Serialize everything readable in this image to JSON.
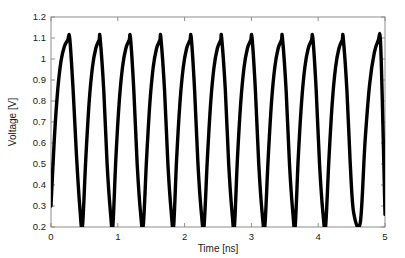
{
  "figure": {
    "background_color": "#ffffff",
    "axis_color": "#8d8d8d",
    "curve_color": "#000000"
  },
  "chart_data": {
    "type": "line",
    "title": "",
    "subtitle": "",
    "xlabel": "Time [ns]",
    "ylabel": "Voltage [V]",
    "xlim": [
      0,
      5
    ],
    "ylim": [
      0.2,
      1.2
    ],
    "xticks": [
      0,
      1,
      2,
      3,
      4,
      5
    ],
    "xticklabels": [
      "0",
      "1",
      "2",
      "3",
      "4",
      "5"
    ],
    "yticks": [
      0.2,
      0.3,
      0.4,
      0.5,
      0.6,
      0.7,
      0.8,
      0.9,
      1.0,
      1.1,
      1.2
    ],
    "yticklabels": [
      "0.2",
      "0.3",
      "0.4",
      "0.5",
      "0.6",
      "0.7",
      "0.8",
      "0.9",
      "1",
      "1.1",
      "1.2"
    ],
    "grid": false,
    "legend": null,
    "annotations": [],
    "series": [
      {
        "name": "ring-oscillator-output",
        "line_color": "#000000",
        "line_width": 3.4,
        "waveform": "relaxation-oscillation",
        "period_ns": 0.4545,
        "cycles": 11,
        "peak_voltage": 1.1,
        "valley_voltage": 0.2,
        "start_voltage": 0.3,
        "rise_fraction": 0.62,
        "fall_fraction": 0.38,
        "peak_times_ns": [
          0.28,
          0.735,
          1.19,
          1.645,
          2.1,
          2.555,
          3.01,
          3.465,
          3.92,
          4.375,
          4.93
        ],
        "valley_times_ns": [
          0.47,
          0.925,
          1.38,
          1.835,
          2.29,
          2.745,
          3.2,
          3.655,
          4.11,
          4.63
        ],
        "x": [
          0.0,
          0.05,
          0.1,
          0.15,
          0.2,
          0.25,
          0.28,
          0.33,
          0.38,
          0.43,
          0.47,
          0.52,
          0.57,
          0.62,
          0.67,
          0.72,
          0.735,
          0.79,
          0.84,
          0.89,
          0.925,
          0.97,
          1.02,
          1.07,
          1.12,
          1.17,
          1.19,
          1.24,
          1.29,
          1.34,
          1.38,
          1.43,
          1.48,
          1.53,
          1.58,
          1.63,
          1.645,
          1.7,
          1.75,
          1.8,
          1.835,
          1.88,
          1.93,
          1.98,
          2.03,
          2.08,
          2.1,
          2.15,
          2.2,
          2.25,
          2.29,
          2.34,
          2.39,
          2.44,
          2.49,
          2.54,
          2.555,
          2.61,
          2.66,
          2.71,
          2.745,
          2.79,
          2.84,
          2.89,
          2.94,
          2.99,
          3.01,
          3.06,
          3.11,
          3.16,
          3.2,
          3.25,
          3.3,
          3.35,
          3.4,
          3.45,
          3.465,
          3.52,
          3.57,
          3.62,
          3.655,
          3.7,
          3.75,
          3.8,
          3.85,
          3.9,
          3.92,
          3.97,
          4.02,
          4.07,
          4.11,
          4.16,
          4.21,
          4.26,
          4.31,
          4.36,
          4.375,
          4.43,
          4.48,
          4.53,
          4.63,
          4.7,
          4.77,
          4.84,
          4.9,
          4.93,
          4.96,
          5.0
        ],
        "y": [
          0.3,
          0.62,
          0.85,
          0.99,
          1.06,
          1.09,
          1.1,
          0.86,
          0.55,
          0.3,
          0.2,
          0.52,
          0.79,
          0.96,
          1.05,
          1.09,
          1.1,
          0.85,
          0.5,
          0.27,
          0.2,
          0.52,
          0.79,
          0.96,
          1.05,
          1.09,
          1.1,
          0.85,
          0.5,
          0.27,
          0.2,
          0.52,
          0.79,
          0.96,
          1.05,
          1.09,
          1.1,
          0.85,
          0.5,
          0.27,
          0.2,
          0.52,
          0.79,
          0.96,
          1.05,
          1.09,
          1.1,
          0.85,
          0.5,
          0.27,
          0.2,
          0.52,
          0.79,
          0.96,
          1.05,
          1.09,
          1.1,
          0.85,
          0.5,
          0.27,
          0.2,
          0.52,
          0.79,
          0.96,
          1.05,
          1.09,
          1.1,
          0.85,
          0.5,
          0.27,
          0.2,
          0.52,
          0.79,
          0.96,
          1.05,
          1.09,
          1.1,
          0.85,
          0.5,
          0.27,
          0.2,
          0.52,
          0.79,
          0.96,
          1.05,
          1.09,
          1.1,
          0.85,
          0.5,
          0.27,
          0.2,
          0.52,
          0.79,
          0.96,
          1.05,
          1.09,
          1.1,
          0.85,
          0.5,
          0.27,
          0.22,
          0.6,
          0.88,
          1.03,
          1.09,
          1.1,
          0.8,
          0.26
        ]
      }
    ]
  }
}
